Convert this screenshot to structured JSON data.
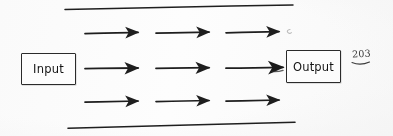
{
  "document": {
    "kind": "hand-drawn-flow-diagram",
    "medium": "scanned notebook page",
    "background_color": "#fdfdfd",
    "ink_color": "#1e1e1e",
    "page_number": "203"
  },
  "nodes": [
    {
      "id": "input",
      "label": "Input",
      "shape": "rectangle",
      "x": 21,
      "y": 53,
      "width": 55,
      "height": 32
    },
    {
      "id": "output",
      "label": "Output",
      "shape": "rectangle",
      "x": 286,
      "y": 50,
      "width": 55,
      "height": 33
    }
  ],
  "arrow_rows": [
    {
      "id": "row-top",
      "y": 33,
      "count": 3,
      "arrows": [
        {
          "x1": 85,
          "x2": 140
        },
        {
          "x1": 156,
          "x2": 211
        },
        {
          "x1": 226,
          "x2": 281
        }
      ]
    },
    {
      "id": "row-middle",
      "y": 68,
      "count": 3,
      "connects_from": "input",
      "connects_to": "output",
      "arrows": [
        {
          "x1": 85,
          "x2": 140
        },
        {
          "x1": 156,
          "x2": 211
        },
        {
          "x1": 226,
          "x2": 285
        }
      ]
    },
    {
      "id": "row-bottom",
      "y": 101,
      "count": 3,
      "arrows": [
        {
          "x1": 85,
          "x2": 140
        },
        {
          "x1": 156,
          "x2": 211
        },
        {
          "x1": 226,
          "x2": 281
        }
      ]
    }
  ],
  "rules": [
    {
      "id": "rule-top",
      "x1": 65,
      "y1": 9,
      "x2": 293,
      "y2": 5
    },
    {
      "id": "rule-bottom",
      "x1": 68,
      "y1": 128,
      "x2": 295,
      "y2": 122
    }
  ],
  "stray_marks": [
    {
      "id": "stray-mark-top-right",
      "x": 288,
      "y": 32,
      "note": "faint pencil smudge"
    }
  ],
  "labels": {
    "input": "Input",
    "output": "Output",
    "page_number": "203"
  }
}
